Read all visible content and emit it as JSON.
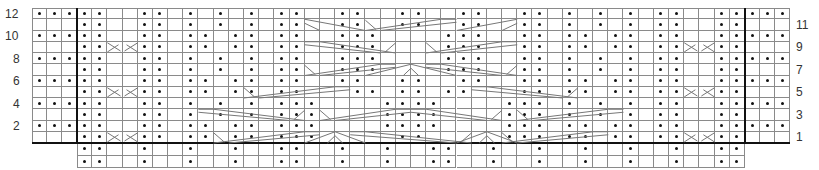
{
  "chart": {
    "left_row_labels": [
      {
        "label": "12",
        "row": 12
      },
      {
        "label": "10",
        "row": 10
      },
      {
        "label": "8",
        "row": 8
      },
      {
        "label": "6",
        "row": 6
      },
      {
        "label": "4",
        "row": 4
      },
      {
        "label": "2",
        "row": 2
      }
    ],
    "right_row_labels": [
      {
        "label": "11",
        "row": 11
      },
      {
        "label": "9",
        "row": 9
      },
      {
        "label": "7",
        "row": 7
      },
      {
        "label": "5",
        "row": 5
      },
      {
        "label": "3",
        "row": 3
      },
      {
        "label": "1",
        "row": 1
      }
    ],
    "legend": {
      "dot": "purl on RS",
      "blank": "knit on RS",
      "diagonal": "cable cross"
    },
    "grid": {
      "left_block_cols": 3,
      "main_cols": 44,
      "right_block_cols": 3,
      "rows": 12,
      "extra_bottom_rows": 2
    },
    "rows": {
      "12": "...|..--..-.-.-.-..--..--..--.-..--..--..-.-.-.-..--..|...",
      "11": "---|..--..-.-.-.-..--..cc..cc..--..--..cc..cc..-.-.-.-..--..|---",
      "10": "...|..--..-..-..-..--...--....--...--..-..-..-..--..|...",
      "9": "---|..cc..-..-..-..--...cccccccc...--..-..-..-..cc..|---",
      "8": "...|..--..-.-.-.-..--...--....--...--..-.-.-.-..--..|...",
      "7": "---|..--..-.-.-.-..--...cccccccc...--..-.-.-.-..--..|---",
      "6": "...|..--..-..-..-..--..--..--..--..--..-..-..-..--..|...",
      "5": "---|..cc..-..-..-..--..cc..cc..cc..--..-..-..-..cc..|---",
      "4": "...|..--..-.-.-.-..--....--..--....--..-.-.-.-..--..|...",
      "3": "---|..--..-.-.-.-..cccccccc..cccccccc..-.-.-.-..--..|---",
      "2": "...|..--..-..-..-..--....--..--....--..-..-..-..--..|...",
      "1": "---|..cc..-..-..-..cc..cc..cc..cc..cc..-..-..-..cc..|---",
      "0b": "---|..--..-.-.-.-..--..--..--..--..--..-.-.-.-..--..|---",
      "-1b": "---|..--..-.-.-.-..--..--..--..--..--..-.-.-.-..--..|---"
    },
    "purl_cells": {
      "12": {
        "left": [
          0,
          1,
          2
        ],
        "main": [
          0,
          1,
          4,
          5,
          7,
          9,
          11,
          13,
          14,
          17,
          18,
          21,
          22,
          25,
          26,
          29,
          30,
          32,
          34,
          36,
          38,
          39,
          42,
          43
        ],
        "right": [
          0,
          1,
          2
        ]
      },
      "11": {
        "left": [],
        "main": [
          0,
          1,
          4,
          5,
          7,
          9,
          11,
          13,
          14,
          17,
          18,
          21,
          22,
          25,
          26,
          29,
          30,
          32,
          34,
          36,
          38,
          39,
          42,
          43
        ],
        "right": []
      },
      "10": {
        "left": [
          0,
          1,
          2
        ],
        "main": [
          0,
          1,
          4,
          5,
          7,
          8,
          10,
          11,
          13,
          14,
          17,
          18,
          19,
          24,
          25,
          26,
          29,
          30,
          32,
          33,
          35,
          36,
          38,
          39,
          42,
          43
        ],
        "right": [
          0,
          1,
          2
        ]
      },
      "9": {
        "left": [],
        "main": [
          0,
          1,
          4,
          5,
          7,
          8,
          10,
          11,
          13,
          14,
          17,
          18,
          19,
          24,
          25,
          26,
          29,
          30,
          32,
          33,
          35,
          36,
          38,
          39,
          42,
          43
        ],
        "right": []
      },
      "8": {
        "left": [
          0,
          1,
          2
        ],
        "main": [
          0,
          1,
          4,
          5,
          7,
          9,
          11,
          13,
          14,
          17,
          18,
          19,
          24,
          25,
          26,
          29,
          30,
          32,
          34,
          36,
          38,
          39,
          42,
          43
        ],
        "right": [
          0,
          1,
          2
        ]
      },
      "7": {
        "left": [],
        "main": [
          0,
          1,
          4,
          5,
          7,
          9,
          11,
          13,
          14,
          17,
          18,
          19,
          24,
          25,
          26,
          29,
          30,
          32,
          34,
          36,
          38,
          39,
          42,
          43
        ],
        "right": []
      },
      "6": {
        "left": [
          0,
          1,
          2
        ],
        "main": [
          0,
          1,
          4,
          5,
          7,
          8,
          10,
          11,
          13,
          14,
          17,
          18,
          21,
          22,
          25,
          26,
          29,
          30,
          32,
          33,
          35,
          36,
          38,
          39,
          42,
          43
        ],
        "right": [
          0,
          1,
          2
        ]
      },
      "5": {
        "left": [],
        "main": [
          0,
          1,
          4,
          5,
          7,
          8,
          10,
          11,
          13,
          14,
          18,
          19,
          21,
          22,
          24,
          25,
          29,
          30,
          32,
          33,
          35,
          36,
          38,
          39,
          42,
          43
        ],
        "right": []
      },
      "4": {
        "left": [
          0,
          1,
          2
        ],
        "main": [
          0,
          1,
          4,
          5,
          7,
          9,
          11,
          13,
          14,
          15,
          20,
          21,
          22,
          23,
          28,
          29,
          30,
          32,
          34,
          36,
          38,
          39,
          42,
          43
        ],
        "right": [
          0,
          1,
          2
        ]
      },
      "3": {
        "left": [],
        "main": [
          0,
          1,
          4,
          5,
          7,
          9,
          11,
          13,
          14,
          15,
          20,
          21,
          22,
          23,
          28,
          29,
          30,
          32,
          34,
          36,
          38,
          39,
          42,
          43
        ],
        "right": []
      },
      "2": {
        "left": [
          0,
          1,
          2
        ],
        "main": [
          0,
          1,
          4,
          5,
          7,
          8,
          10,
          11,
          13,
          14,
          15,
          20,
          21,
          22,
          23,
          28,
          29,
          30,
          32,
          33,
          35,
          36,
          38,
          39,
          42,
          43
        ],
        "right": [
          0,
          1,
          2
        ]
      },
      "1": {
        "left": [],
        "main": [
          0,
          1,
          4,
          5,
          7,
          8,
          10,
          11,
          13,
          14,
          15,
          21,
          22,
          28,
          29,
          30,
          32,
          33,
          35,
          36,
          38,
          39,
          42,
          43
        ],
        "right": []
      },
      "e1": {
        "main": [
          0,
          1,
          4,
          7,
          10,
          13,
          14,
          17,
          20,
          23,
          24,
          27,
          30,
          33,
          36,
          39,
          42,
          43
        ]
      },
      "e2": {
        "main": [
          0,
          1,
          4,
          7,
          10,
          13,
          14,
          17,
          20,
          23,
          24,
          27,
          30,
          33,
          36,
          39,
          42,
          43
        ]
      }
    },
    "cables": [
      {
        "row": 9,
        "cols": [
          2,
          3
        ],
        "type": "X2"
      },
      {
        "row": 5,
        "cols": [
          2,
          3
        ],
        "type": "X2"
      },
      {
        "row": 1,
        "cols": [
          2,
          3
        ],
        "type": "X2"
      },
      {
        "row": 9,
        "cols": [
          40,
          41
        ],
        "type": "X2"
      },
      {
        "row": 5,
        "cols": [
          40,
          41
        ],
        "type": "X2"
      },
      {
        "row": 1,
        "cols": [
          40,
          41
        ],
        "type": "X2"
      },
      {
        "row": 11,
        "cols": [
          15,
          16,
          17,
          18
        ],
        "type": "left-down"
      },
      {
        "row": 11,
        "cols": [
          19,
          20,
          21,
          22,
          23,
          24
        ],
        "type": "wide-left"
      },
      {
        "row": 11,
        "cols": [
          25,
          26,
          27,
          28
        ],
        "type": "right-down"
      },
      {
        "row": 9,
        "cols": [
          15,
          16,
          17,
          18,
          19,
          20
        ],
        "type": "wide-right"
      },
      {
        "row": 9,
        "cols": [
          23,
          24,
          25,
          26,
          27,
          28
        ],
        "type": "wide-left"
      },
      {
        "row": 7,
        "cols": [
          15,
          16,
          17,
          18,
          19,
          20
        ],
        "type": "wide-left"
      },
      {
        "row": 7,
        "cols": [
          19,
          20,
          21,
          22,
          23,
          24
        ],
        "type": "peak"
      },
      {
        "row": 7,
        "cols": [
          23,
          24,
          25,
          26,
          27,
          28
        ],
        "type": "wide-right"
      },
      {
        "row": 5,
        "cols": [
          11,
          12,
          13,
          14,
          15,
          16,
          17
        ],
        "type": "wide-left"
      },
      {
        "row": 5,
        "cols": [
          26,
          27,
          28,
          29,
          30,
          31,
          32
        ],
        "type": "wide-right"
      },
      {
        "row": 3,
        "cols": [
          8,
          9,
          10,
          11,
          12,
          13,
          14
        ],
        "type": "wide-right"
      },
      {
        "row": 3,
        "cols": [
          16,
          17,
          18,
          19,
          20,
          21
        ],
        "type": "wide-left"
      },
      {
        "row": 3,
        "cols": [
          22,
          23,
          24,
          25,
          26,
          27
        ],
        "type": "wide-right"
      },
      {
        "row": 3,
        "cols": [
          29,
          30,
          31,
          32,
          33,
          34,
          35
        ],
        "type": "wide-left"
      },
      {
        "row": 1,
        "cols": [
          9,
          10,
          11,
          12,
          13,
          14,
          15
        ],
        "type": "wide-left"
      },
      {
        "row": 1,
        "cols": [
          15,
          16,
          17,
          18
        ],
        "type": "peak"
      },
      {
        "row": 1,
        "cols": [
          18,
          19,
          20,
          21,
          22,
          23,
          24,
          25
        ],
        "type": "wide-right"
      },
      {
        "row": 1,
        "cols": [
          25,
          26,
          27,
          28
        ],
        "type": "peak"
      },
      {
        "row": 1,
        "cols": [
          28,
          29,
          30,
          31,
          32,
          33,
          34
        ],
        "type": "wide-left"
      }
    ]
  }
}
